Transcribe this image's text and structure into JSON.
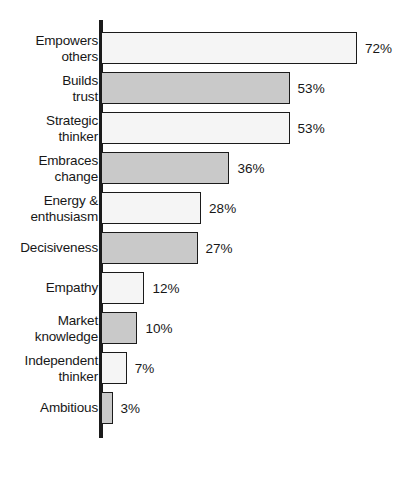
{
  "chart_data": {
    "type": "bar",
    "orientation": "horizontal",
    "title": "",
    "subtitle": "",
    "xlabel": "",
    "ylabel": "",
    "xlim": [
      0,
      72
    ],
    "grid": false,
    "legend": false,
    "value_suffix": "%",
    "categories": [
      "Empowers\nothers",
      "Builds\ntrust",
      "Strategic\nthinker",
      "Embraces\nchange",
      "Energy &\nenthusiasm",
      "Decisiveness",
      "Empathy",
      "Market\nknowledge",
      "Independent\nthinker",
      "Ambitious"
    ],
    "values": [
      72,
      53,
      53,
      36,
      28,
      27,
      12,
      10,
      7,
      3
    ],
    "value_labels": [
      "72%",
      "53%",
      "53%",
      "36%",
      "28%",
      "27%",
      "12%",
      "10%",
      "7%",
      "3%"
    ],
    "bar_fills": [
      "light",
      "dark",
      "light",
      "dark",
      "light",
      "dark",
      "light",
      "dark",
      "light",
      "dark"
    ],
    "colors": {
      "light_fill": "#f5f5f5",
      "dark_fill": "#c9c9c9",
      "bar_outline": "#1b1b1b",
      "axis": "#1b1b1b",
      "text": "#171717",
      "background": "#ffffff"
    },
    "px_per_unit": 3.54
  }
}
